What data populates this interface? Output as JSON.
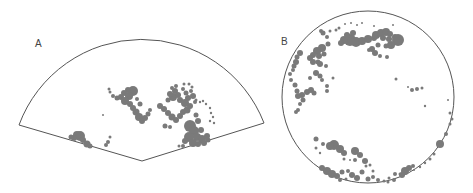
{
  "panels": [
    {
      "label": "A",
      "shape": "sector",
      "outline_color": "#555555",
      "blob_color": "#7a7a7a",
      "blobs": [
        [
          80,
          136,
          5
        ],
        [
          77,
          135,
          4
        ],
        [
          74,
          138,
          3
        ],
        [
          83,
          140,
          3
        ],
        [
          71,
          137,
          2.5
        ],
        [
          87,
          144,
          3.5
        ],
        [
          90,
          146,
          2.5
        ],
        [
          108,
          142,
          2
        ],
        [
          106,
          145,
          2
        ],
        [
          110,
          137,
          1.5
        ],
        [
          133,
          91,
          5
        ],
        [
          128,
          90,
          3
        ],
        [
          124,
          93,
          3
        ],
        [
          129,
          96,
          4
        ],
        [
          121,
          97,
          3
        ],
        [
          117,
          98,
          2.5
        ],
        [
          113,
          96,
          2
        ],
        [
          110,
          92,
          1.5
        ],
        [
          109,
          89,
          1.5
        ],
        [
          125,
          101,
          4
        ],
        [
          130,
          104,
          3
        ],
        [
          133,
          108,
          3
        ],
        [
          136,
          112,
          3.5
        ],
        [
          139,
          117,
          4
        ],
        [
          142,
          121,
          3
        ],
        [
          145,
          118,
          3
        ],
        [
          148,
          114,
          2.5
        ],
        [
          150,
          110,
          2
        ],
        [
          137,
          99,
          2
        ],
        [
          140,
          104,
          2.5
        ],
        [
          103,
          115,
          1
        ],
        [
          173,
          97,
          4
        ],
        [
          170,
          94,
          3
        ],
        [
          175,
          91,
          3
        ],
        [
          178,
          95,
          3
        ],
        [
          168,
          100,
          2.5
        ],
        [
          180,
          100,
          3
        ],
        [
          185,
          103,
          4
        ],
        [
          188,
          98,
          3
        ],
        [
          183,
          89,
          2
        ],
        [
          186,
          93,
          2.5
        ],
        [
          193,
          96,
          3
        ],
        [
          191,
          91,
          2
        ],
        [
          172,
          88,
          2
        ],
        [
          176,
          86,
          2
        ],
        [
          160,
          106,
          3
        ],
        [
          164,
          109,
          3
        ],
        [
          168,
          113,
          3
        ],
        [
          172,
          117,
          3.5
        ],
        [
          176,
          120,
          3
        ],
        [
          180,
          116,
          3
        ],
        [
          183,
          112,
          3
        ],
        [
          187,
          110,
          3.5
        ],
        [
          190,
          106,
          3
        ],
        [
          195,
          102,
          2
        ],
        [
          165,
          126,
          2.5
        ],
        [
          170,
          127,
          2
        ],
        [
          190,
          126,
          6
        ],
        [
          194,
          131,
          5
        ],
        [
          189,
          137,
          5
        ],
        [
          197,
          137,
          4
        ],
        [
          202,
          139,
          4
        ],
        [
          207,
          136,
          3
        ],
        [
          201,
          130,
          3
        ],
        [
          185,
          141,
          3
        ],
        [
          193,
          143,
          4
        ],
        [
          198,
          144,
          3
        ],
        [
          204,
          143,
          3
        ],
        [
          208,
          140,
          2.5
        ],
        [
          198,
          121,
          3
        ],
        [
          196,
          115,
          2.5
        ],
        [
          183,
          146,
          2
        ],
        [
          179,
          146,
          1.5
        ],
        [
          184,
          84,
          1.5
        ],
        [
          189,
          84,
          1.5
        ],
        [
          192,
          87,
          1.5
        ],
        [
          196,
          100,
          1.5
        ],
        [
          200,
          102,
          1.2
        ],
        [
          203,
          101,
          1.2
        ],
        [
          206,
          104,
          1.2
        ],
        [
          210,
          108,
          1.2
        ],
        [
          211,
          113,
          1.2
        ],
        [
          213,
          117,
          1.2
        ],
        [
          210,
          121,
          1.2
        ],
        [
          214,
          123,
          1.2
        ]
      ]
    },
    {
      "label": "B",
      "shape": "circle",
      "outline_color": "#555555",
      "blob_color": "#7a7a7a",
      "blobs": [
        [
          350,
          40,
          6
        ],
        [
          344,
          40,
          4
        ],
        [
          356,
          42,
          5
        ],
        [
          362,
          41,
          4
        ],
        [
          368,
          39,
          4
        ],
        [
          374,
          38,
          3
        ],
        [
          341,
          43,
          3
        ],
        [
          347,
          35,
          3
        ],
        [
          353,
          33,
          3
        ],
        [
          376,
          35,
          4
        ],
        [
          381,
          33,
          4
        ],
        [
          386,
          32,
          4
        ],
        [
          390,
          34,
          3
        ],
        [
          383,
          38,
          3
        ],
        [
          389,
          39,
          3
        ],
        [
          395,
          37,
          3
        ],
        [
          398,
          40,
          6
        ],
        [
          391,
          45,
          4
        ],
        [
          386,
          46,
          2.5
        ],
        [
          378,
          45,
          2.5
        ],
        [
          372,
          49,
          3
        ],
        [
          375,
          53,
          3
        ],
        [
          380,
          56,
          2
        ],
        [
          387,
          57,
          2
        ],
        [
          369,
          50,
          2
        ],
        [
          322,
          48,
          4
        ],
        [
          317,
          51,
          4
        ],
        [
          313,
          55,
          3
        ],
        [
          319,
          56,
          3
        ],
        [
          324,
          54,
          2.5
        ],
        [
          310,
          58,
          3
        ],
        [
          318,
          62,
          2.5
        ],
        [
          328,
          44,
          2.5
        ],
        [
          327,
          37,
          2
        ],
        [
          323,
          33,
          2.5
        ],
        [
          321,
          31,
          2
        ],
        [
          330,
          31,
          1.5
        ],
        [
          336,
          30,
          1.5
        ],
        [
          339,
          28,
          1.5
        ],
        [
          345,
          24,
          1
        ],
        [
          351,
          23,
          1
        ],
        [
          357,
          25,
          1
        ],
        [
          362,
          23,
          1
        ],
        [
          374,
          26,
          1
        ],
        [
          393,
          25,
          1
        ],
        [
          300,
          53,
          3
        ],
        [
          297,
          57,
          2.5
        ],
        [
          296,
          62,
          3
        ],
        [
          294,
          66,
          2.5
        ],
        [
          293,
          70,
          2
        ],
        [
          290,
          74,
          2
        ],
        [
          291,
          80,
          2
        ],
        [
          295,
          85,
          2.5
        ],
        [
          297,
          91,
          2.5
        ],
        [
          298,
          96,
          3
        ],
        [
          302,
          95,
          3
        ],
        [
          307,
          92,
          3
        ],
        [
          311,
          90,
          3
        ],
        [
          314,
          93,
          2.5
        ],
        [
          303,
          100,
          2.5
        ],
        [
          300,
          104,
          2
        ],
        [
          298,
          110,
          2
        ],
        [
          296,
          112,
          2
        ],
        [
          313,
          62,
          3
        ],
        [
          320,
          64,
          3
        ],
        [
          326,
          66,
          2
        ],
        [
          316,
          73,
          3
        ],
        [
          320,
          76,
          2.5
        ],
        [
          310,
          78,
          2
        ],
        [
          322,
          80,
          2
        ],
        [
          327,
          86,
          2
        ],
        [
          327,
          91,
          2
        ],
        [
          333,
          78,
          1.5
        ],
        [
          396,
          79,
          1.5
        ],
        [
          412,
          90,
          2
        ],
        [
          417,
          89,
          2
        ],
        [
          422,
          88,
          1.5
        ],
        [
          408,
          87,
          1
        ],
        [
          425,
          106,
          1.2
        ],
        [
          448,
          100,
          1
        ],
        [
          450,
          113,
          1.5
        ],
        [
          452,
          119,
          1.5
        ],
        [
          450,
          124,
          1.5
        ],
        [
          446,
          134,
          2
        ],
        [
          440,
          144,
          4
        ],
        [
          434,
          154,
          1.5
        ],
        [
          430,
          159,
          1.5
        ],
        [
          425,
          163,
          1.2
        ],
        [
          420,
          167,
          1.2
        ],
        [
          414,
          170,
          1
        ],
        [
          316,
          139,
          2.5
        ],
        [
          323,
          144,
          2
        ],
        [
          334,
          145,
          5
        ],
        [
          330,
          146,
          4
        ],
        [
          340,
          149,
          4
        ],
        [
          344,
          153,
          3
        ],
        [
          355,
          151,
          4
        ],
        [
          360,
          155,
          3
        ],
        [
          355,
          160,
          2
        ],
        [
          365,
          161,
          3
        ],
        [
          370,
          165,
          1.5
        ],
        [
          344,
          159,
          1.5
        ],
        [
          350,
          160,
          1
        ],
        [
          316,
          148,
          1.5
        ],
        [
          320,
          153,
          1.2
        ],
        [
          322,
          168,
          3
        ],
        [
          327,
          171,
          4
        ],
        [
          332,
          174,
          4
        ],
        [
          337,
          176,
          3
        ],
        [
          342,
          172,
          2.5
        ],
        [
          348,
          171,
          2
        ],
        [
          352,
          175,
          3
        ],
        [
          357,
          178,
          3
        ],
        [
          362,
          172,
          2.5
        ],
        [
          368,
          179,
          2.5
        ],
        [
          373,
          177,
          2
        ],
        [
          378,
          180,
          2
        ],
        [
          384,
          181,
          1.5
        ],
        [
          389,
          178,
          1.5
        ],
        [
          395,
          174,
          2
        ],
        [
          400,
          174,
          1.5
        ],
        [
          394,
          180,
          2
        ],
        [
          388,
          182,
          1.5
        ],
        [
          346,
          179,
          1.5
        ],
        [
          340,
          180,
          2
        ],
        [
          405,
          171,
          4
        ],
        [
          402,
          175,
          3
        ],
        [
          409,
          168,
          3
        ],
        [
          413,
          166,
          2
        ],
        [
          366,
          166,
          1.5
        ],
        [
          373,
          171,
          1.5
        ]
      ]
    }
  ]
}
